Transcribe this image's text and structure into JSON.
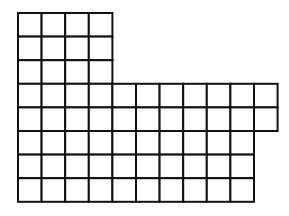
{
  "diagram": {
    "type": "grid-shape",
    "stroke_color": "#111111",
    "background": "#ffffff",
    "cell_size": 23.6,
    "origin": {
      "x": 18,
      "y": 13
    },
    "sections": [
      {
        "name": "top-block",
        "row_start": 0,
        "rows": 3,
        "cols": 4
      },
      {
        "name": "middle-band",
        "row_start": 3,
        "rows": 2,
        "cols": 11
      },
      {
        "name": "bottom-block",
        "row_start": 5,
        "rows": 3,
        "cols": 10
      }
    ],
    "total_squares": 74
  }
}
